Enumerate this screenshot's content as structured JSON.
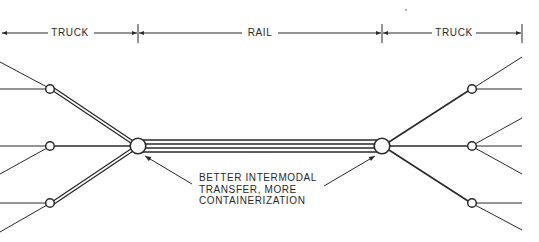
{
  "diagram": {
    "type": "transport-network",
    "dimension_line": {
      "segments": [
        {
          "id": "truck-left",
          "label": "TRUCK",
          "from_x": 2,
          "to_x": 138
        },
        {
          "id": "rail",
          "label": "RAIL",
          "from_x": 138,
          "to_x": 382
        },
        {
          "id": "truck-right",
          "label": "TRUCK",
          "from_x": 382,
          "to_x": 522
        }
      ]
    },
    "hubs": [
      {
        "id": "left-terminal",
        "x": 138,
        "y": 146
      },
      {
        "id": "right-terminal",
        "x": 382,
        "y": 146
      }
    ],
    "rail_link": {
      "tracks": 4,
      "from": "left-terminal",
      "to": "right-terminal"
    },
    "truck_nodes_left": [
      {
        "id": "L1",
        "x": 50,
        "y": 89,
        "link": "double"
      },
      {
        "id": "L2",
        "x": 50,
        "y": 146,
        "link": "single"
      },
      {
        "id": "L3",
        "x": 50,
        "y": 203,
        "link": "double"
      }
    ],
    "truck_nodes_right": [
      {
        "id": "R1",
        "x": 472,
        "y": 89,
        "link": "single"
      },
      {
        "id": "R2",
        "x": 472,
        "y": 146,
        "link": "single"
      },
      {
        "id": "R3",
        "x": 472,
        "y": 203,
        "link": "single"
      }
    ],
    "annotation": {
      "lines": [
        "BETTER INTERMODAL",
        "TRANSFER, MORE",
        "CONTAINERIZATION"
      ],
      "points_to": [
        "left-terminal",
        "right-terminal"
      ]
    },
    "colors": {
      "ink": "#2a2a2a",
      "background": "#ffffff"
    }
  }
}
